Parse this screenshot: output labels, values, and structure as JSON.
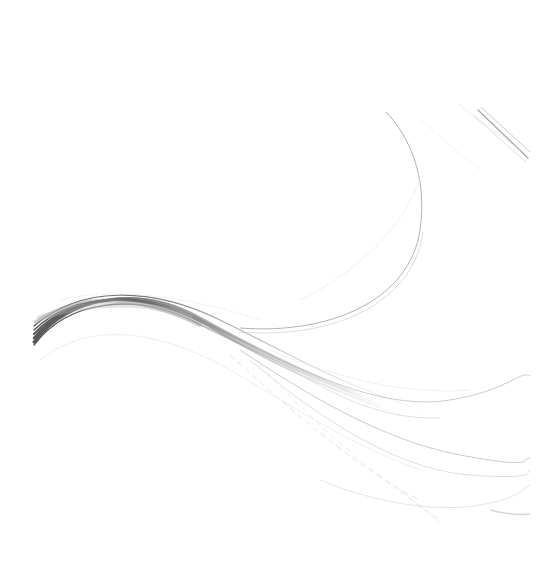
{
  "artwork": {
    "description": "Abstract grey wave swoosh on white background",
    "background_color": "#ffffff",
    "stroke_colors": {
      "dark": "#555555",
      "mid": "#8a8a8a",
      "light": "#bdbdbd",
      "faint": "#dcdcdc"
    }
  }
}
